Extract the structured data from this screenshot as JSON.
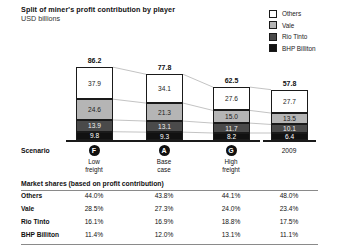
{
  "header": {
    "title": "Split of miner's profit contribution by player",
    "subtitle": "USD billions"
  },
  "legend": {
    "items": [
      {
        "label": "Others",
        "color": "#ffffff"
      },
      {
        "label": "Vale",
        "color": "#b5b5b5"
      },
      {
        "label": "Rio Tinto",
        "color": "#4a4a4a"
      },
      {
        "label": "BHP Billiton",
        "color": "#111111"
      }
    ]
  },
  "scenario": {
    "row_label": "Scenario",
    "columns": [
      {
        "badge": "F",
        "line1": "Low",
        "line2": "freight"
      },
      {
        "badge": "A",
        "line1": "Base",
        "line2": "case"
      },
      {
        "badge": "G",
        "line1": "High",
        "line2": "freight"
      },
      {
        "badge": "",
        "line1": "2009",
        "line2": ""
      }
    ]
  },
  "market_shares": {
    "title": "Market shares (based on profit contribution)",
    "rows": [
      {
        "name": "Others",
        "values": [
          "44.0%",
          "43.8%",
          "44.1%",
          "48.0%"
        ]
      },
      {
        "name": "Vale",
        "values": [
          "28.5%",
          "27.3%",
          "24.0%",
          "23.4%"
        ]
      },
      {
        "name": "Rio Tinto",
        "values": [
          "16.1%",
          "16.9%",
          "18.8%",
          "17.5%"
        ]
      },
      {
        "name": "BHP Billiton",
        "values": [
          "11.4%",
          "12.0%",
          "13.1%",
          "11.1%"
        ]
      }
    ]
  },
  "chart_data": {
    "type": "bar",
    "stacked": true,
    "title": "Split of miner's profit contribution by player",
    "ylabel": "USD billions",
    "xlabel": "",
    "grid": false,
    "legend_position": "top-right",
    "categories": [
      "Low freight",
      "Base case",
      "High freight",
      "2009"
    ],
    "totals": [
      86.2,
      77.8,
      62.5,
      57.8
    ],
    "ylim": [
      0,
      90
    ],
    "series": [
      {
        "name": "Others",
        "color": "#ffffff",
        "values": [
          37.9,
          34.1,
          27.6,
          27.7
        ]
      },
      {
        "name": "Vale",
        "color": "#b5b5b5",
        "values": [
          24.6,
          21.3,
          15.0,
          13.5
        ]
      },
      {
        "name": "Rio Tinto",
        "color": "#4a4a4a",
        "values": [
          13.9,
          13.1,
          11.7,
          10.1
        ]
      },
      {
        "name": "BHP Billiton",
        "color": "#111111",
        "values": [
          9.8,
          9.3,
          8.2,
          6.4
        ]
      }
    ],
    "bars": [
      {
        "total": "86.2",
        "segments": [
          {
            "key": "others",
            "label": "37.9"
          },
          {
            "key": "vale",
            "label": "24.6"
          },
          {
            "key": "rio",
            "label": "13.9"
          },
          {
            "key": "bhp",
            "label": "9.8"
          }
        ]
      },
      {
        "total": "77.8",
        "segments": [
          {
            "key": "others",
            "label": "34.1"
          },
          {
            "key": "vale",
            "label": "21.3"
          },
          {
            "key": "rio",
            "label": "13.1"
          },
          {
            "key": "bhp",
            "label": "9.3"
          }
        ]
      },
      {
        "total": "62.5",
        "segments": [
          {
            "key": "others",
            "label": "27.6"
          },
          {
            "key": "vale",
            "label": "15.0"
          },
          {
            "key": "rio",
            "label": "11.7"
          },
          {
            "key": "bhp",
            "label": "8.2"
          }
        ]
      },
      {
        "total": "57.8",
        "segments": [
          {
            "key": "others",
            "label": "27.7"
          },
          {
            "key": "vale",
            "label": "13.5"
          },
          {
            "key": "rio",
            "label": "10.1"
          },
          {
            "key": "bhp",
            "label": "6.4"
          }
        ]
      }
    ]
  }
}
